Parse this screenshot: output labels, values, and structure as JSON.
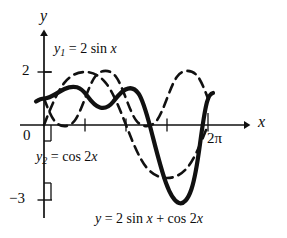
{
  "figure": {
    "kind": "math-function-plot",
    "background_color": "#ffffff",
    "ink_color": "#111111"
  },
  "axes": {
    "y_axis_label": "y",
    "x_axis_label": "x",
    "origin_label": "0",
    "y_tick_labels": [
      "2",
      "−3"
    ],
    "x_tick_labels": [
      "2π"
    ],
    "x_tick_values": [
      "π/2",
      "π",
      "3π/2",
      "2π"
    ],
    "xlim": [
      -0.28,
      7.45
    ],
    "ylim": [
      -3.45,
      2.55
    ],
    "grid": false
  },
  "annotations": {
    "curve1": {
      "name": "y1",
      "sub": "1",
      "eq": " = 2 sin ",
      "var": "x",
      "full": "y₁ = 2 sin x"
    },
    "curve2": {
      "name": "y2",
      "sub": "2",
      "eq": " = cos 2",
      "var": "x",
      "full": "y₂ = cos 2x"
    },
    "caption": {
      "name": "y",
      "eq": " = 2 sin ",
      "var": "x",
      "tail": " + cos 2",
      "var2": "x",
      "full": "y = 2 sin x + cos 2x"
    }
  },
  "chart_data": {
    "type": "line",
    "title": "y = 2 sin x + cos 2x",
    "xlabel": "x",
    "ylabel": "y",
    "xlim": [
      -0.28,
      7.45
    ],
    "ylim": [
      -3.45,
      2.55
    ],
    "grid": false,
    "legend": "inline-annotations",
    "x": [
      0,
      0.3927,
      0.7854,
      1.1781,
      1.5708,
      1.9635,
      2.3562,
      2.7489,
      3.1416,
      3.5343,
      3.927,
      4.3197,
      4.7124,
      5.1051,
      5.4978,
      5.8905,
      6.2832
    ],
    "series": [
      {
        "name": "y₁ = 2 sin x",
        "style": "dashed",
        "amplitude": 2,
        "values": [
          0,
          0.765,
          1.414,
          1.848,
          2,
          1.848,
          1.414,
          0.765,
          0,
          -0.765,
          -1.414,
          -1.848,
          -2,
          -1.848,
          -1.414,
          -0.765,
          0
        ]
      },
      {
        "name": "y₂ = cos 2x",
        "style": "dashed",
        "amplitude": 1,
        "values": [
          1,
          0.707,
          0,
          -0.707,
          -1,
          -0.707,
          0,
          0.707,
          1,
          0.707,
          0,
          -0.707,
          -1,
          -0.707,
          0,
          0.707,
          1
        ]
      },
      {
        "name": "y = 2 sin x + cos 2x",
        "style": "solid-bold",
        "values": [
          1,
          1.472,
          1.414,
          1.141,
          1,
          1.141,
          1.414,
          1.472,
          1,
          -0.058,
          -1.414,
          -2.555,
          -3,
          -2.555,
          -1.414,
          -0.058,
          1
        ]
      }
    ],
    "notes": {
      "max_of_sum": 1.5,
      "min_of_sum": -3,
      "period": "2π"
    }
  }
}
